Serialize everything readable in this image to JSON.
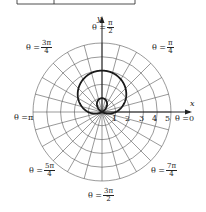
{
  "figure": {
    "type": "polar-graph",
    "curve": "limacon with inner loop, r = 1 + 2 sin θ",
    "curve_color": "#1a1a1a",
    "grid_color": "#555555",
    "rings": [
      1,
      2,
      3,
      4,
      5
    ],
    "spokes_deg_step": 15
  },
  "axes": {
    "x_label": "x",
    "y_label": "y"
  },
  "ticks": [
    "1",
    "2",
    "3",
    "4",
    "5"
  ],
  "angle_labels": {
    "zero": {
      "prefix": "θ = ",
      "value": "0"
    },
    "pi_over_4": {
      "prefix": "θ = ",
      "num": "π",
      "den": "4"
    },
    "pi_over_2": {
      "prefix": "θ = ",
      "num": "π",
      "den": "2"
    },
    "three_pi_over_4": {
      "prefix": "θ = ",
      "num": "3π",
      "den": "4"
    },
    "pi": {
      "prefix": "θ = ",
      "value": "π"
    },
    "five_pi_over_4": {
      "prefix": "θ = ",
      "num": "5π",
      "den": "4"
    },
    "three_pi_over_2": {
      "prefix": "θ = ",
      "num": "3π",
      "den": "2"
    },
    "seven_pi_over_4": {
      "prefix": "θ = ",
      "num": "7π",
      "den": "4"
    }
  }
}
